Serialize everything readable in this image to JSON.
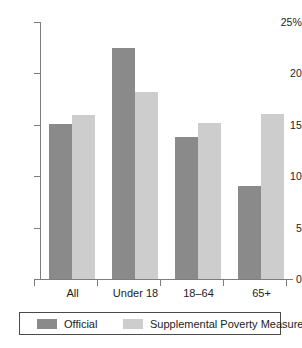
{
  "chart_data": {
    "type": "bar",
    "title": "",
    "subtitle": "",
    "xlabel": "",
    "ylabel": "",
    "ylim": [
      0,
      25
    ],
    "yticks": [
      0,
      5,
      10,
      15,
      20,
      25
    ],
    "ytick_labels": [
      "0",
      "5",
      "10",
      "15",
      "20",
      "25%"
    ],
    "grid": false,
    "legend_position": "bottom",
    "categories": [
      "All",
      "Under 18",
      "18–64",
      "65+"
    ],
    "series": [
      {
        "name": "Official",
        "color": "#8a8a8a",
        "values": [
          15.1,
          22.5,
          13.8,
          9.1
        ]
      },
      {
        "name": "Supplemental Poverty Measure",
        "color": "#cdcdcd",
        "values": [
          16.0,
          18.2,
          15.2,
          16.1
        ]
      }
    ]
  },
  "legend": {
    "items": [
      {
        "label": "Official",
        "color": "#8a8a8a"
      },
      {
        "label": "Supplemental Poverty Measure",
        "color": "#cdcdcd"
      }
    ]
  },
  "axis": {
    "line_color": "#7d7d7d"
  }
}
